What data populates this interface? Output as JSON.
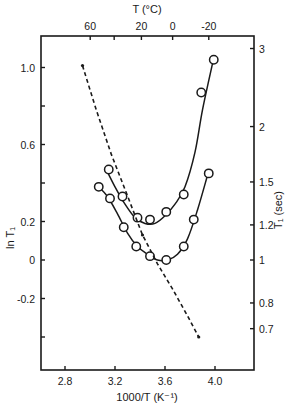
{
  "chart_data": {
    "type": "scatter",
    "title": "",
    "xlabel": "1000/T (K⁻¹)",
    "ylabel": "ln T₁",
    "ylabel_right": "T₁ (sec)",
    "xlabel_top": "T (°C)",
    "xlim": [
      2.6,
      4.3
    ],
    "ylim": [
      -0.57,
      1.17
    ],
    "grid": false,
    "legend": null,
    "x_ticks": [
      2.8,
      3.2,
      3.6,
      4.0
    ],
    "x_tick_labels": [
      "2.8",
      "3.2",
      "3.6",
      "4.0"
    ],
    "y_ticks": [
      -0.4,
      -0.2,
      0,
      0.2,
      0.4,
      0.6,
      0.8,
      1.0
    ],
    "y_tick_labels": [
      "",
      "-0.2",
      "0",
      "0.2",
      "",
      "0.6",
      "",
      "1.0"
    ],
    "top_ticks_celsius": [
      60,
      40,
      20,
      0,
      -20
    ],
    "top_tick_labels": [
      "60",
      "",
      "20",
      "0",
      "-20"
    ],
    "right_ticks_sec": [
      3,
      2,
      1.5,
      1.2,
      1,
      0.8,
      0.7
    ],
    "right_tick_labels": [
      "3",
      "2",
      "1.5",
      "1.2",
      "1",
      "0.8",
      "0.7"
    ],
    "series": [
      {
        "name": "upper curve (open circles)",
        "style": "circles-solid-fit",
        "x": [
          3.15,
          3.26,
          3.38,
          3.48,
          3.61,
          3.75,
          3.89,
          3.99
        ],
        "y": [
          0.47,
          0.33,
          0.22,
          0.21,
          0.25,
          0.34,
          0.87,
          1.04
        ],
        "fit_x": [
          3.13,
          3.2,
          3.28,
          3.36,
          3.44,
          3.52,
          3.6,
          3.68,
          3.76,
          3.84,
          3.9,
          3.98
        ],
        "fit_y": [
          0.47,
          0.38,
          0.29,
          0.22,
          0.19,
          0.19,
          0.23,
          0.29,
          0.38,
          0.56,
          0.78,
          1.02
        ]
      },
      {
        "name": "lower curve (open circles)",
        "style": "circles-solid-fit",
        "x": [
          3.07,
          3.16,
          3.27,
          3.37,
          3.48,
          3.61,
          3.75,
          3.83,
          3.95
        ],
        "y": [
          0.38,
          0.32,
          0.17,
          0.07,
          0.02,
          0.0,
          0.07,
          0.21,
          0.45
        ],
        "fit_x": [
          3.07,
          3.14,
          3.22,
          3.3,
          3.38,
          3.46,
          3.54,
          3.62,
          3.7,
          3.78,
          3.86,
          3.94
        ],
        "fit_y": [
          0.38,
          0.33,
          0.24,
          0.14,
          0.07,
          0.03,
          0.0,
          0.0,
          0.03,
          0.11,
          0.26,
          0.44
        ]
      },
      {
        "name": "dashed line",
        "style": "dashed-with-dots",
        "x": [
          2.94,
          3.05,
          3.17,
          3.29,
          3.42,
          3.54,
          3.66,
          3.78,
          3.87
        ],
        "y": [
          1.01,
          0.78,
          0.55,
          0.35,
          0.13,
          -0.02,
          -0.15,
          -0.29,
          -0.4
        ]
      }
    ]
  },
  "colors": {
    "ink": "#1a1a1a",
    "background": "#ffffff"
  }
}
